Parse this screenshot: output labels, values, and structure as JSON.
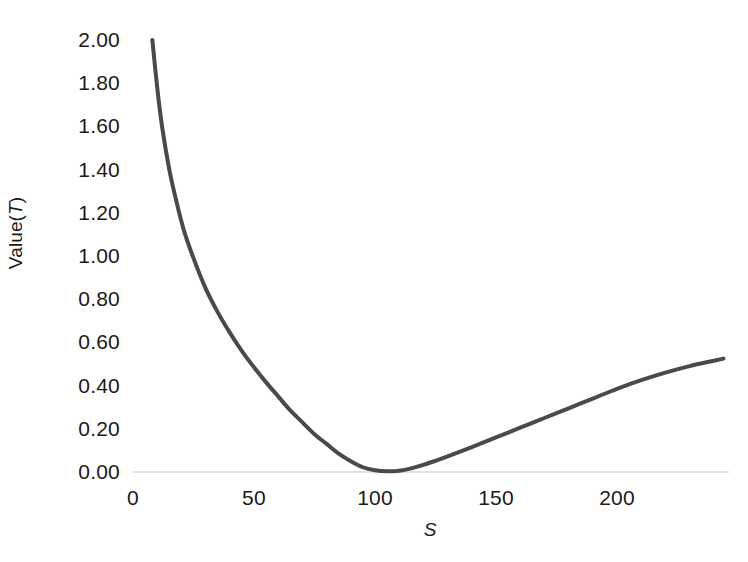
{
  "chart_data": {
    "type": "line",
    "title": "",
    "subtitle": "",
    "xlabel": "S",
    "ylabel": "Value(T)",
    "ylabel_parts": {
      "prefix": "Value(",
      "italic": "T",
      "suffix": ")"
    },
    "xlim": [
      0,
      245
    ],
    "ylim": [
      0,
      2.0
    ],
    "grid": false,
    "legend": null,
    "axis_line_color": "#d9d9d9",
    "series": [
      {
        "name": "Value(T)",
        "color": "#4a4a4a",
        "line_width": 4,
        "x": [
          8,
          10,
          12,
          15,
          18,
          21,
          25,
          30,
          35,
          40,
          45,
          50,
          55,
          60,
          65,
          70,
          75,
          80,
          85,
          90,
          95,
          100,
          105,
          110,
          115,
          120,
          125,
          130,
          140,
          150,
          160,
          170,
          180,
          190,
          200,
          210,
          220,
          230,
          240,
          244
        ],
        "y": [
          2.0,
          1.78,
          1.6,
          1.4,
          1.25,
          1.12,
          0.99,
          0.85,
          0.74,
          0.645,
          0.56,
          0.485,
          0.415,
          0.35,
          0.285,
          0.23,
          0.175,
          0.13,
          0.085,
          0.05,
          0.022,
          0.008,
          0.003,
          0.006,
          0.017,
          0.033,
          0.052,
          0.072,
          0.115,
          0.16,
          0.205,
          0.25,
          0.295,
          0.34,
          0.385,
          0.425,
          0.46,
          0.49,
          0.515,
          0.525
        ]
      }
    ],
    "y_ticks": [
      {
        "value": 2.0,
        "label": "2.00"
      },
      {
        "value": 1.8,
        "label": "1.80"
      },
      {
        "value": 1.6,
        "label": "1.60"
      },
      {
        "value": 1.4,
        "label": "1.40"
      },
      {
        "value": 1.2,
        "label": "1.20"
      },
      {
        "value": 1.0,
        "label": "1.00"
      },
      {
        "value": 0.8,
        "label": "0.80"
      },
      {
        "value": 0.6,
        "label": "0.60"
      },
      {
        "value": 0.4,
        "label": "0.40"
      },
      {
        "value": 0.2,
        "label": "0.20"
      },
      {
        "value": 0.0,
        "label": "0.00"
      }
    ],
    "x_ticks": [
      {
        "value": 0,
        "label": "0"
      },
      {
        "value": 50,
        "label": "50"
      },
      {
        "value": 100,
        "label": "100"
      },
      {
        "value": 150,
        "label": "150"
      },
      {
        "value": 200,
        "label": "200"
      }
    ]
  }
}
